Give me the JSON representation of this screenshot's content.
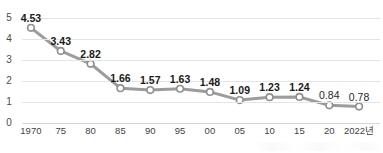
{
  "chart_data": {
    "type": "line",
    "title": "",
    "subtitle": "",
    "xlabel": "",
    "ylabel": "",
    "categories": [
      "1970",
      "75",
      "80",
      "85",
      "90",
      "95",
      "00",
      "05",
      "10",
      "15",
      "20",
      "2022년"
    ],
    "values": [
      4.53,
      3.43,
      2.82,
      1.66,
      1.57,
      1.63,
      1.48,
      1.09,
      1.23,
      1.24,
      0.84,
      0.78
    ],
    "point_labels": [
      "4.53",
      "3.43",
      "2.82",
      "1.66",
      "1.57",
      "1.63",
      "1.48",
      "1.09",
      "1.23",
      "1.24",
      "0.84",
      "0.78"
    ],
    "ylim": [
      0,
      5
    ],
    "y_ticks": [
      0,
      1,
      2,
      3,
      4,
      5
    ],
    "y_tick_labels": [
      "0",
      "1",
      "2",
      "3",
      "4",
      "5"
    ],
    "grid": true,
    "grid_axis": "y",
    "legend": false,
    "legend_position": "none",
    "series": [
      {
        "name": "",
        "values": [
          4.53,
          3.43,
          2.82,
          1.66,
          1.57,
          1.63,
          1.48,
          1.09,
          1.23,
          1.24,
          0.84,
          0.78
        ]
      }
    ],
    "colors": {
      "line": "#9c9c9c",
      "marker_fill": "#ffffff",
      "marker_stroke": "#8f8f8f",
      "grid": "#e4e4e4",
      "axis_text": "#4b4b4b",
      "label_text": "#1a1a1a"
    },
    "marker": "circle-open",
    "line_width": 3
  }
}
